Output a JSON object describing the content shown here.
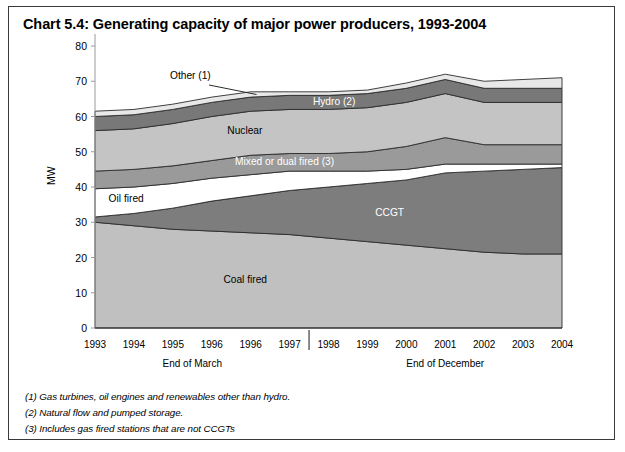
{
  "title": "Chart 5.4: Generating capacity of major power producers, 1993-2004",
  "axis": {
    "ylabel": "MW",
    "yticks": [
      "80",
      "70",
      "60",
      "50",
      "40",
      "30",
      "20",
      "10",
      "0"
    ],
    "ylim": [
      0,
      80
    ],
    "xticks": [
      "1993",
      "1994",
      "1995",
      "1996",
      "1996",
      "1997",
      "1998",
      "1999",
      "2000",
      "2001",
      "2002",
      "2003",
      "2004"
    ],
    "group_labels": [
      "End of March",
      "End of December"
    ]
  },
  "series_labels": {
    "other": "Other (1)",
    "hydro": "Hydro (2)",
    "nuclear": "Nuclear",
    "mixed": "Mixed or dual fired (3)",
    "oil": "Oil fired",
    "ccgt": "CCGT",
    "coal": "Coal fired"
  },
  "footnotes": [
    "(1) Gas turbines, oil engines and renewables other than hydro.",
    "(2) Natural flow and pumped storage.",
    "(3) Includes gas fired stations that are not CCGTs"
  ],
  "colors": {
    "coal": "#c0c0c0",
    "ccgt": "#7d7d7d",
    "oil": "#ffffff",
    "mixed": "#9a9a9a",
    "nuclear": "#c4c4c4",
    "hydro": "#787878",
    "other": "#e8e8e8",
    "outline": "#2b2b2b",
    "border": "#3a3a3a"
  },
  "chart_data": {
    "type": "area",
    "title": "Chart 5.4: Generating capacity of major power producers, 1993-2004",
    "xlabel": "",
    "ylabel": "MW",
    "ylim": [
      0,
      80
    ],
    "grid": false,
    "legend": "in-plot labels",
    "categories": [
      "1993",
      "1994",
      "1995",
      "1996",
      "1996",
      "1997",
      "1998",
      "1999",
      "2000",
      "2001",
      "2002",
      "2003",
      "2004"
    ],
    "stacked": true,
    "series": [
      {
        "name": "Coal fired",
        "values": [
          30.0,
          29.0,
          28.0,
          27.5,
          27.0,
          26.5,
          25.5,
          24.5,
          23.5,
          22.5,
          21.5,
          21.0,
          21.0
        ]
      },
      {
        "name": "CCGT",
        "values": [
          1.5,
          3.5,
          6.0,
          8.5,
          10.5,
          12.5,
          14.5,
          16.5,
          18.5,
          21.5,
          23.0,
          24.0,
          24.5
        ]
      },
      {
        "name": "Oil fired",
        "values": [
          8.0,
          7.5,
          7.0,
          6.5,
          6.0,
          5.5,
          4.5,
          3.5,
          3.0,
          2.5,
          2.0,
          1.5,
          1.0
        ]
      },
      {
        "name": "Mixed or dual fired (3)",
        "values": [
          5.0,
          5.0,
          5.0,
          5.0,
          5.5,
          5.0,
          5.0,
          5.5,
          6.5,
          7.5,
          5.5,
          5.5,
          5.5
        ]
      },
      {
        "name": "Nuclear",
        "values": [
          11.5,
          11.5,
          12.0,
          12.5,
          12.5,
          12.5,
          12.5,
          12.5,
          12.5,
          12.5,
          12.0,
          12.0,
          12.0
        ]
      },
      {
        "name": "Hydro (2)",
        "values": [
          4.0,
          4.0,
          4.0,
          4.0,
          4.0,
          4.0,
          4.0,
          4.0,
          4.0,
          4.0,
          4.0,
          4.0,
          4.0
        ]
      },
      {
        "name": "Other (1)",
        "values": [
          1.5,
          1.5,
          1.5,
          1.5,
          1.5,
          1.0,
          1.0,
          1.0,
          1.5,
          1.5,
          2.0,
          2.5,
          3.0
        ]
      }
    ],
    "totals": [
      61.5,
      62.0,
      63.5,
      65.5,
      67.0,
      67.0,
      67.0,
      67.5,
      69.5,
      72.0,
      70.0,
      70.5,
      71.0
    ]
  }
}
